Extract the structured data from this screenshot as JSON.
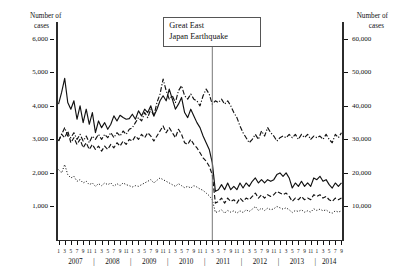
{
  "left_axis": {
    "title_line1": "Number of",
    "title_line2": "cases",
    "ticks": [
      "6,000",
      "5,000",
      "4,000",
      "3,000",
      "2,000",
      "1,000"
    ],
    "tick_values": [
      6000,
      5000,
      4000,
      3000,
      2000,
      1000
    ]
  },
  "right_axis": {
    "title_line1": "Number of",
    "title_line2": "cases",
    "ticks": [
      "60,000",
      "50,000",
      "40,000",
      "30,000",
      "20,000",
      "10,000"
    ],
    "tick_values": [
      60000,
      50000,
      40000,
      30000,
      20000,
      10000
    ]
  },
  "annotation": {
    "line1": "Great East",
    "line2": "Japan Earthquake",
    "marker_year": 2011,
    "marker_month": 3
  },
  "x_axis": {
    "month_tick_labels": [
      "1",
      "3",
      "5",
      "7",
      "9",
      "11"
    ],
    "years": [
      "2007",
      "2008",
      "2009",
      "2010",
      "2011",
      "2012",
      "2013",
      "2014"
    ],
    "separator": "|"
  },
  "chart_data": {
    "type": "line",
    "title": "",
    "xlabel": "",
    "ylabel": "Number of cases",
    "ylim": [
      0,
      6500
    ],
    "y2lim": [
      0,
      65000
    ],
    "grid": false,
    "legend_position": "none",
    "x_start": "2007-01",
    "x_end": "2014-09",
    "x": [
      "2007-01",
      "2007-02",
      "2007-03",
      "2007-04",
      "2007-05",
      "2007-06",
      "2007-07",
      "2007-08",
      "2007-09",
      "2007-10",
      "2007-11",
      "2007-12",
      "2008-01",
      "2008-02",
      "2008-03",
      "2008-04",
      "2008-05",
      "2008-06",
      "2008-07",
      "2008-08",
      "2008-09",
      "2008-10",
      "2008-11",
      "2008-12",
      "2009-01",
      "2009-02",
      "2009-03",
      "2009-04",
      "2009-05",
      "2009-06",
      "2009-07",
      "2009-08",
      "2009-09",
      "2009-10",
      "2009-11",
      "2009-12",
      "2010-01",
      "2010-02",
      "2010-03",
      "2010-04",
      "2010-05",
      "2010-06",
      "2010-07",
      "2010-08",
      "2010-09",
      "2010-10",
      "2010-11",
      "2010-12",
      "2011-01",
      "2011-02",
      "2011-03",
      "2011-04",
      "2011-05",
      "2011-06",
      "2011-07",
      "2011-08",
      "2011-09",
      "2011-10",
      "2011-11",
      "2011-12",
      "2012-01",
      "2012-02",
      "2012-03",
      "2012-04",
      "2012-05",
      "2012-06",
      "2012-07",
      "2012-08",
      "2012-09",
      "2012-10",
      "2012-11",
      "2012-12",
      "2013-01",
      "2013-02",
      "2013-03",
      "2013-04",
      "2013-05",
      "2013-06",
      "2013-07",
      "2013-08",
      "2013-09",
      "2013-10",
      "2013-11",
      "2013-12",
      "2014-01",
      "2014-02",
      "2014-03",
      "2014-04",
      "2014-05",
      "2014-06",
      "2014-07",
      "2014-08",
      "2014-09"
    ],
    "series": [
      {
        "name": "series-solid",
        "axis": "left",
        "style": "solid",
        "values": [
          4050,
          4400,
          4820,
          4100,
          3900,
          4150,
          3600,
          4000,
          3500,
          3900,
          3450,
          3800,
          3200,
          3550,
          3350,
          3500,
          3300,
          3450,
          3700,
          3550,
          3720,
          3650,
          3600,
          3620,
          3750,
          3600,
          3850,
          3700,
          3900,
          3800,
          4000,
          3700,
          3900,
          4150,
          4300,
          4150,
          4500,
          4200,
          3900,
          4050,
          4250,
          3800,
          3650,
          3900,
          3700,
          3500,
          3350,
          3100,
          2900,
          2700,
          2300,
          1450,
          1500,
          1650,
          1500,
          1700,
          1500,
          1600,
          1500,
          1700,
          1550,
          1700,
          1600,
          1750,
          1850,
          1700,
          1800,
          1700,
          1800,
          1750,
          1800,
          1950,
          2000,
          1900,
          2000,
          1850,
          1550,
          1700,
          1600,
          1750,
          1600,
          1700,
          1600,
          1850,
          1800,
          1900,
          1750,
          1800,
          1650,
          1550,
          1700,
          1600,
          1700
        ]
      },
      {
        "name": "series-dashed",
        "axis": "left",
        "style": "dashed",
        "values": [
          2950,
          3150,
          3050,
          3250,
          2900,
          3050,
          2850,
          3000,
          2750,
          2900,
          2700,
          2850,
          2700,
          2800,
          2650,
          2800,
          2700,
          2850,
          2750,
          2900,
          2800,
          2950,
          2850,
          3000,
          2950,
          3100,
          3000,
          3150,
          3050,
          3200,
          3100,
          2950,
          3100,
          3250,
          3400,
          3200,
          3350,
          3200,
          3050,
          3300,
          3150,
          2900,
          2850,
          3000,
          2850,
          2750,
          2600,
          2450,
          2350,
          2200,
          1950,
          1100,
          1150,
          1250,
          1100,
          1250,
          1150,
          1200,
          1100,
          1250,
          1150,
          1250,
          1200,
          1300,
          1400,
          1250,
          1350,
          1250,
          1350,
          1300,
          1350,
          1450,
          1400,
          1350,
          1400,
          1300,
          1150,
          1250,
          1200,
          1300,
          1200,
          1250,
          1200,
          1350,
          1300,
          1350,
          1250,
          1300,
          1200,
          1150,
          1250,
          1200,
          1250
        ]
      },
      {
        "name": "series-dotted",
        "axis": "left",
        "style": "dotted",
        "values": [
          2100,
          2000,
          2250,
          1950,
          1850,
          1900,
          1750,
          1800,
          1700,
          1750,
          1650,
          1700,
          1600,
          1680,
          1620,
          1700,
          1650,
          1700,
          1600,
          1680,
          1620,
          1700,
          1650,
          1620,
          1580,
          1620,
          1600,
          1650,
          1700,
          1750,
          1800,
          1700,
          1780,
          1850,
          1800,
          1750,
          1700,
          1650,
          1600,
          1680,
          1620,
          1560,
          1600,
          1550,
          1620,
          1580,
          1520,
          1480,
          1400,
          1320,
          1200,
          820,
          850,
          900,
          800,
          880,
          830,
          870,
          800,
          870,
          820,
          900,
          850,
          920,
          1000,
          880,
          950,
          880,
          950,
          900,
          930,
          1000,
          960,
          920,
          960,
          900,
          820,
          880,
          850,
          900,
          830,
          870,
          830,
          930,
          880,
          920,
          870,
          900,
          830,
          800,
          870,
          830,
          870
        ]
      },
      {
        "name": "series-dashdot",
        "axis": "right",
        "style": "dashdot",
        "values": [
          29500,
          31500,
          33500,
          31000,
          30500,
          32000,
          30000,
          31500,
          29500,
          31000,
          29000,
          31000,
          30000,
          31500,
          30000,
          31500,
          30500,
          32000,
          30500,
          32000,
          31000,
          32500,
          31500,
          33000,
          33500,
          35000,
          36500,
          35500,
          38000,
          36500,
          39000,
          37000,
          41000,
          43500,
          48000,
          44500,
          42000,
          43000,
          41000,
          44500,
          46000,
          43000,
          42000,
          43500,
          42000,
          41500,
          40000,
          43000,
          45000,
          43500,
          40500,
          41500,
          41000,
          42000,
          40500,
          41500,
          40000,
          38000,
          36500,
          34000,
          32000,
          30500,
          29000,
          30000,
          31500,
          30000,
          32500,
          31000,
          33500,
          32000,
          31000,
          29500,
          30500,
          31000,
          30500,
          31500,
          30500,
          31500,
          30000,
          31500,
          30500,
          31500,
          30000,
          31000,
          30500,
          31000,
          30000,
          31500,
          30000,
          29000,
          31500,
          30500,
          32000
        ]
      }
    ]
  }
}
